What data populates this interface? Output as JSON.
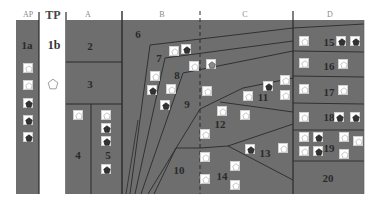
{
  "diagram": {
    "background": "#ffffff",
    "fill_color": "#6e6e6e",
    "fill_dark": "#5a5a5a",
    "line_color": "#2a2a2a",
    "columns": [
      {
        "id": "AP",
        "label": "AP",
        "x": 23
      },
      {
        "id": "TP",
        "label": "TP",
        "x": 55
      },
      {
        "id": "A",
        "label": "A",
        "x": 88
      },
      {
        "id": "B",
        "label": "B",
        "x": 162
      },
      {
        "id": "C",
        "label": "C",
        "x": 245
      },
      {
        "id": "D",
        "label": "D",
        "x": 330
      }
    ],
    "regions": [
      {
        "id": "1a",
        "label": "1a",
        "x": 27,
        "y": 45
      },
      {
        "id": "1b",
        "label": "1b",
        "x": 54,
        "y": 45
      },
      {
        "id": "2",
        "label": "2",
        "x": 90,
        "y": 46
      },
      {
        "id": "3",
        "label": "3",
        "x": 90,
        "y": 84
      },
      {
        "id": "4",
        "label": "4",
        "x": 78,
        "y": 155
      },
      {
        "id": "5",
        "label": "5",
        "x": 108,
        "y": 155
      },
      {
        "id": "6",
        "label": "6",
        "x": 138,
        "y": 34
      },
      {
        "id": "7",
        "label": "7",
        "x": 159,
        "y": 58
      },
      {
        "id": "8",
        "label": "8",
        "x": 177,
        "y": 75
      },
      {
        "id": "9",
        "label": "9",
        "x": 187,
        "y": 104
      },
      {
        "id": "10",
        "label": "10",
        "x": 179,
        "y": 170
      },
      {
        "id": "11",
        "label": "11",
        "x": 263,
        "y": 97
      },
      {
        "id": "12",
        "label": "12",
        "x": 220,
        "y": 124
      },
      {
        "id": "13",
        "label": "13",
        "x": 265,
        "y": 153
      },
      {
        "id": "14",
        "label": "14",
        "x": 222,
        "y": 176
      },
      {
        "id": "15",
        "label": "15",
        "x": 329,
        "y": 42
      },
      {
        "id": "16",
        "label": "16",
        "x": 329,
        "y": 66
      },
      {
        "id": "17",
        "label": "17",
        "x": 329,
        "y": 92
      },
      {
        "id": "18",
        "label": "18",
        "x": 329,
        "y": 117
      },
      {
        "id": "19",
        "label": "19",
        "x": 329,
        "y": 148
      },
      {
        "id": "20",
        "label": "20",
        "x": 328,
        "y": 178
      }
    ],
    "markers": [
      {
        "x": 28,
        "y": 68,
        "type": "open"
      },
      {
        "x": 28,
        "y": 85,
        "type": "open"
      },
      {
        "x": 28,
        "y": 103,
        "type": "filled"
      },
      {
        "x": 28,
        "y": 120,
        "type": "filled"
      },
      {
        "x": 28,
        "y": 137,
        "type": "filled"
      },
      {
        "x": 53,
        "y": 82,
        "type": "open-bare"
      },
      {
        "x": 78,
        "y": 115,
        "type": "open"
      },
      {
        "x": 106,
        "y": 115,
        "type": "open"
      },
      {
        "x": 106,
        "y": 128,
        "type": "filled"
      },
      {
        "x": 106,
        "y": 141,
        "type": "filled"
      },
      {
        "x": 106,
        "y": 169,
        "type": "filled"
      },
      {
        "x": 174,
        "y": 51,
        "type": "open"
      },
      {
        "x": 186,
        "y": 49,
        "type": "filled"
      },
      {
        "x": 155,
        "y": 76,
        "type": "open"
      },
      {
        "x": 152,
        "y": 90,
        "type": "filled"
      },
      {
        "x": 171,
        "y": 89,
        "type": "open"
      },
      {
        "x": 165,
        "y": 105,
        "type": "filled"
      },
      {
        "x": 194,
        "y": 66,
        "type": "open"
      },
      {
        "x": 211,
        "y": 64,
        "type": "grey"
      },
      {
        "x": 207,
        "y": 91,
        "type": "open"
      },
      {
        "x": 268,
        "y": 86,
        "type": "filled"
      },
      {
        "x": 285,
        "y": 80,
        "type": "open"
      },
      {
        "x": 285,
        "y": 95,
        "type": "open"
      },
      {
        "x": 248,
        "y": 96,
        "type": "open"
      },
      {
        "x": 222,
        "y": 111,
        "type": "open"
      },
      {
        "x": 245,
        "y": 115,
        "type": "open"
      },
      {
        "x": 205,
        "y": 134,
        "type": "open"
      },
      {
        "x": 205,
        "y": 157,
        "type": "open"
      },
      {
        "x": 250,
        "y": 149,
        "type": "filled"
      },
      {
        "x": 283,
        "y": 148,
        "type": "open"
      },
      {
        "x": 235,
        "y": 166,
        "type": "open"
      },
      {
        "x": 205,
        "y": 179,
        "type": "open"
      },
      {
        "x": 235,
        "y": 185,
        "type": "open"
      },
      {
        "x": 304,
        "y": 41,
        "type": "open"
      },
      {
        "x": 341,
        "y": 41,
        "type": "filled"
      },
      {
        "x": 355,
        "y": 41,
        "type": "filled"
      },
      {
        "x": 304,
        "y": 63,
        "type": "open"
      },
      {
        "x": 343,
        "y": 64,
        "type": "open"
      },
      {
        "x": 304,
        "y": 89,
        "type": "open"
      },
      {
        "x": 343,
        "y": 90,
        "type": "open"
      },
      {
        "x": 304,
        "y": 117,
        "type": "open"
      },
      {
        "x": 339,
        "y": 117,
        "type": "filled"
      },
      {
        "x": 355,
        "y": 117,
        "type": "filled"
      },
      {
        "x": 304,
        "y": 137,
        "type": "open"
      },
      {
        "x": 318,
        "y": 137,
        "type": "filled"
      },
      {
        "x": 344,
        "y": 137,
        "type": "open"
      },
      {
        "x": 358,
        "y": 141,
        "type": "open"
      },
      {
        "x": 304,
        "y": 151,
        "type": "open"
      },
      {
        "x": 318,
        "y": 151,
        "type": "filled"
      },
      {
        "x": 344,
        "y": 154,
        "type": "open"
      }
    ]
  }
}
